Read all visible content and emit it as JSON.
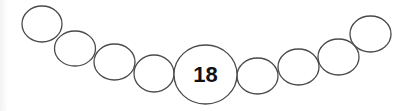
{
  "diagram": {
    "type": "bead-necklace",
    "center_label": "18",
    "beads": [
      {
        "cx": 42,
        "cy": 24,
        "rx": 20,
        "ry": 18
      },
      {
        "cx": 75,
        "cy": 48,
        "rx": 20.5,
        "ry": 17.5
      },
      {
        "cx": 114.5,
        "cy": 62,
        "rx": 20.5,
        "ry": 18
      },
      {
        "cx": 154,
        "cy": 73.5,
        "rx": 20,
        "ry": 18.5
      },
      {
        "cx": 295.5,
        "cy": 76,
        "rx": 20.5,
        "ry": 18
      },
      {
        "cx": 298.5,
        "cy": 67,
        "rx": 20.5,
        "ry": 18
      },
      {
        "cx": 338.5,
        "cy": 57,
        "rx": 20.5,
        "ry": 18
      },
      {
        "cx": 370.5,
        "cy": 34,
        "rx": 20.5,
        "ry": 18
      }
    ],
    "center_bead": {
      "cx": 205.5,
      "cy": 74.5,
      "rx": 31.5,
      "ry": 29.5
    },
    "stroke_color": "#4a4a4a",
    "fill_color": "#ffffff"
  }
}
